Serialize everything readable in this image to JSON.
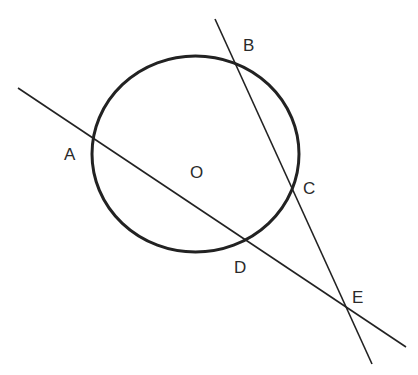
{
  "diagram": {
    "type": "geometry",
    "colors": {
      "stroke": "#222222",
      "background": "#ffffff"
    },
    "circle": {
      "center_label": "O",
      "cx": 195.5,
      "cy": 154,
      "rx": 103.5,
      "ry": 98
    },
    "points": [
      {
        "id": "A",
        "label": "A",
        "x": 92,
        "y": 140,
        "lx": 64,
        "ly": 160
      },
      {
        "id": "B",
        "label": "B",
        "x": 235,
        "y": 63,
        "lx": 243,
        "ly": 51
      },
      {
        "id": "C",
        "label": "C",
        "x": 293,
        "y": 187,
        "lx": 303,
        "ly": 194
      },
      {
        "id": "D",
        "label": "D",
        "x": 244,
        "y": 240,
        "lx": 234,
        "ly": 273
      },
      {
        "id": "E",
        "label": "E",
        "x": 348,
        "y": 310,
        "lx": 352,
        "ly": 303
      },
      {
        "id": "O",
        "label": "O",
        "x": 197,
        "y": 171,
        "lx": 190,
        "ly": 178
      }
    ],
    "lines": [
      {
        "id": "line-AE",
        "through": [
          "A",
          "D",
          "E"
        ],
        "x1": 18,
        "y1": 88,
        "x2": 406,
        "y2": 347
      },
      {
        "id": "line-BE",
        "through": [
          "B",
          "C",
          "E"
        ],
        "x1": 215,
        "y1": 19,
        "x2": 372,
        "y2": 364
      }
    ]
  }
}
